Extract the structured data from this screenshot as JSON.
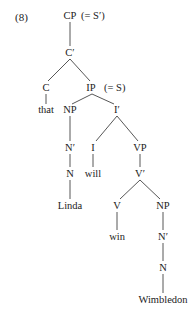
{
  "example_number": "(8)",
  "nodes": {
    "cp": "CP",
    "cp_note": "(= S′)",
    "c_bar": "C′",
    "c": "C",
    "that": "that",
    "ip": "IP",
    "ip_note": "(= S)",
    "np1": "NP",
    "i_bar": "I′",
    "n_bar1": "N′",
    "i": "I",
    "vp": "VP",
    "n1": "N",
    "will": "will",
    "v_bar": "V′",
    "linda": "Linda",
    "v": "V",
    "np2": "NP",
    "win": "win",
    "n_bar2": "N′",
    "n2": "N",
    "wimbledon": "Wimbledon"
  }
}
